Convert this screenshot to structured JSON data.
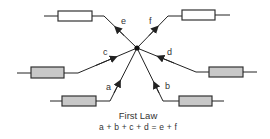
{
  "diagram": {
    "title": "First Law",
    "equation": "a + b + c + d = e + f",
    "junction": {
      "x": 137,
      "y": 48
    },
    "colors": {
      "wire": "#222222",
      "resistor_outline": "#333333",
      "resistor_fill_white": "#ffffff",
      "resistor_fill_gray": "#c8c8c8",
      "label": "#333333"
    },
    "branches": [
      {
        "label": "a",
        "direction": "in",
        "resistor_fill": "gray"
      },
      {
        "label": "b",
        "direction": "in",
        "resistor_fill": "gray"
      },
      {
        "label": "c",
        "direction": "in",
        "resistor_fill": "gray"
      },
      {
        "label": "d",
        "direction": "in",
        "resistor_fill": "gray"
      },
      {
        "label": "e",
        "direction": "out",
        "resistor_fill": "white"
      },
      {
        "label": "f",
        "direction": "out",
        "resistor_fill": "white"
      }
    ]
  }
}
